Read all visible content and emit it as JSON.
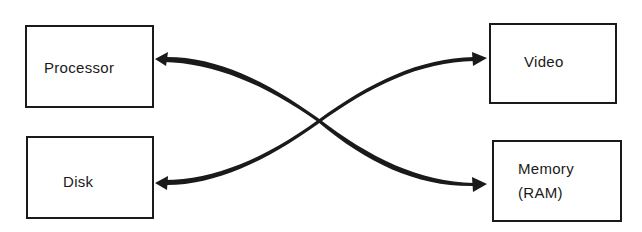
{
  "diagram": {
    "type": "computer-components-connections",
    "nodes": [
      {
        "id": "processor",
        "label": "Processor"
      },
      {
        "id": "disk",
        "label": "Disk"
      },
      {
        "id": "video",
        "label": "Video"
      },
      {
        "id": "memory",
        "label_line1": "Memory",
        "label_line2": "(RAM)"
      }
    ],
    "edges": [
      {
        "from": "processor",
        "to": "memory",
        "direction": "bidirectional"
      },
      {
        "from": "disk",
        "to": "video",
        "direction": "bidirectional"
      }
    ],
    "colors": {
      "stroke": "#1a1a1a",
      "background": "#ffffff"
    }
  }
}
